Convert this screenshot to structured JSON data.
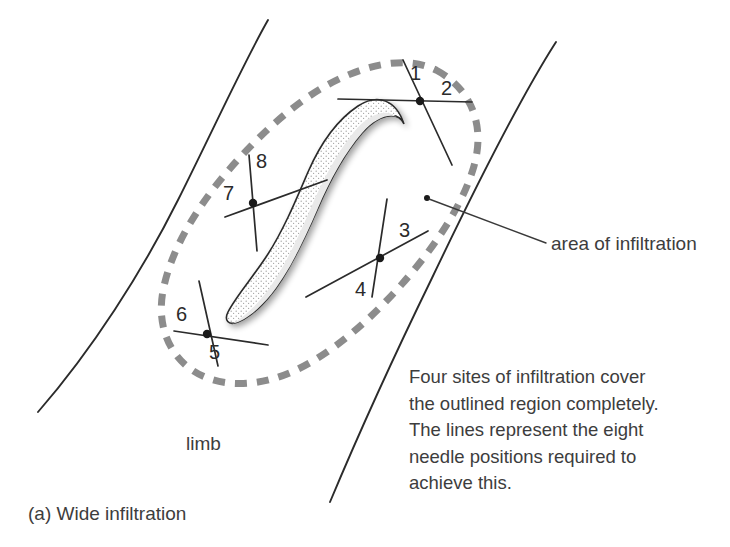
{
  "figure": {
    "caption": "(a) Wide infiltration",
    "limb_label": "limb",
    "area_label": "area of infiltration",
    "description_lines": [
      "Four sites of infiltration cover",
      "the outlined region completely.",
      "The lines represent the eight",
      "needle positions required to",
      "achieve this."
    ]
  },
  "colors": {
    "background": "#ffffff",
    "ink": "#2b2b2b",
    "text": "#3d3d3d",
    "dashed_outline": "#8c8c8c",
    "lesion_fill": "#fdfdfd",
    "lesion_stipple": "#9a9a9a",
    "lesion_shadow": "#cccccc"
  },
  "needle_sites": [
    {
      "id": "site-1-2",
      "center": {
        "x": 420,
        "y": 101
      },
      "labels": [
        {
          "number": "1",
          "x": 418,
          "y": 62
        },
        {
          "number": "2",
          "x": 448,
          "y": 80
        }
      ],
      "needles": [
        {
          "number": "1",
          "x1": 403,
          "y1": 60,
          "x2": 452,
          "y2": 165
        },
        {
          "number": "2",
          "x1": 338,
          "y1": 99,
          "x2": 472,
          "y2": 102
        }
      ]
    },
    {
      "id": "site-3-4",
      "center": {
        "x": 380,
        "y": 258
      },
      "labels": [
        {
          "number": "3",
          "x": 404,
          "y": 232
        },
        {
          "number": "4",
          "x": 360,
          "y": 290
        }
      ],
      "needles": [
        {
          "number": "3",
          "x1": 306,
          "y1": 297,
          "x2": 428,
          "y2": 231
        },
        {
          "number": "4",
          "x1": 387,
          "y1": 199,
          "x2": 372,
          "y2": 297
        }
      ]
    },
    {
      "id": "site-5-6",
      "center": {
        "x": 207,
        "y": 334
      },
      "labels": [
        {
          "number": "6",
          "x": 180,
          "y": 316
        },
        {
          "number": "5",
          "x": 213,
          "y": 353
        }
      ],
      "needles": [
        {
          "number": "6",
          "x1": 174,
          "y1": 331,
          "x2": 268,
          "y2": 345
        },
        {
          "number": "5",
          "x1": 199,
          "y1": 281,
          "x2": 218,
          "y2": 366
        }
      ]
    },
    {
      "id": "site-7-8",
      "center": {
        "x": 253,
        "y": 203
      },
      "labels": [
        {
          "number": "8",
          "x": 260,
          "y": 162
        },
        {
          "number": "7",
          "x": 228,
          "y": 193
        }
      ],
      "needles": [
        {
          "number": "8",
          "x1": 249,
          "y1": 155,
          "x2": 257,
          "y2": 251
        },
        {
          "number": "7",
          "x1": 225,
          "y1": 217,
          "x2": 327,
          "y2": 180
        }
      ]
    }
  ],
  "annotation_leader": {
    "dot": {
      "x": 427,
      "y": 198
    },
    "line": {
      "x1": 429,
      "y1": 199,
      "x2": 546,
      "y2": 243
    },
    "label_position": {
      "x": 551,
      "y": 233
    }
  },
  "limb_label_position": {
    "x": 186,
    "y": 433
  },
  "geometry": {
    "limb_left_edge": "M 268,20 C 230,90 160,250 38,412",
    "limb_right_edge": "M 556,42 C 500,120 420,300 330,502",
    "infiltration_outline_note": "dashed closed tear-drop shaped region",
    "lesion_note": "S-shaped hatched and stippled nerve/vessel cross-section"
  }
}
